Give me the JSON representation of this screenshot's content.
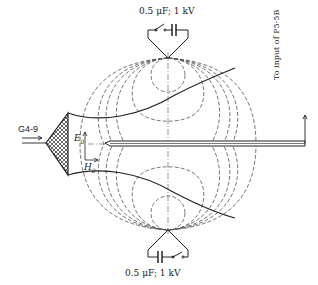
{
  "diagram": {
    "type": "experimental setup schematic",
    "labels": {
      "top_capacitor": "0.5 μF; 1 kV",
      "bottom_capacitor": "0.5 μF; 1 kV",
      "source": "G4-9",
      "output": "To input of P5-5B",
      "e_field": "E",
      "e_sub": "0",
      "h_field": "H",
      "h_sub": "0"
    },
    "components": [
      {
        "name": "horn-antenna",
        "desc": "crosshatched horn feed on left"
      },
      {
        "name": "top-electrode",
        "desc": "pointed electrode with switch and capacitor"
      },
      {
        "name": "bottom-electrode",
        "desc": "pointed electrode with capacitor and switch"
      },
      {
        "name": "probe",
        "desc": "horizontal coaxial probe along axis"
      },
      {
        "name": "field-lines",
        "desc": "dashed field/equipotential lines between electrodes"
      }
    ],
    "colors": {
      "line": "#222222",
      "dash": "#555555",
      "background": "#ffffff"
    }
  }
}
